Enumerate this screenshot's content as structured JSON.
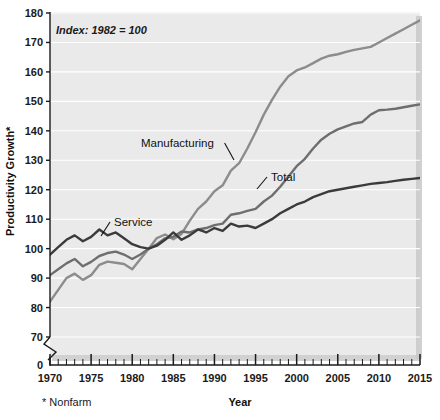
{
  "chart_data": {
    "type": "line",
    "title": "",
    "subtitle": "",
    "note": "Index: 1982 = 100",
    "footnote": "* Nonfarm",
    "xlabel": "Year",
    "ylabel": "Productivity Growth*",
    "xlim": [
      1970,
      2015
    ],
    "ylim": [
      70,
      180
    ],
    "y_axis_break": true,
    "y_break_value": 0,
    "grid": true,
    "grid_orientation": "horizontal",
    "legend_position": "inline-annotations",
    "xticks": [
      1970,
      1975,
      1980,
      1985,
      1990,
      1995,
      2000,
      2005,
      2010,
      2015
    ],
    "xtick_labels": [
      "1970",
      "1975",
      "1980",
      "1985",
      "1990",
      "1995",
      "2000",
      "2005",
      "2010",
      "2015"
    ],
    "xminor_step": 1,
    "yticks": [
      0,
      70,
      80,
      90,
      100,
      110,
      120,
      130,
      140,
      150,
      160,
      170,
      180
    ],
    "ytick_labels": [
      "0",
      "70",
      "80",
      "90",
      "100",
      "110",
      "120",
      "130",
      "140",
      "150",
      "160",
      "170",
      "180"
    ],
    "x": [
      1970,
      1971,
      1972,
      1973,
      1974,
      1975,
      1976,
      1977,
      1978,
      1979,
      1980,
      1981,
      1982,
      1983,
      1984,
      1985,
      1986,
      1987,
      1988,
      1989,
      1990,
      1991,
      1992,
      1993,
      1994,
      1995,
      1996,
      1997,
      1998,
      1999,
      2000,
      2001,
      2002,
      2003,
      2004,
      2005,
      2006,
      2007,
      2008,
      2009,
      2010,
      2011,
      2012,
      2013,
      2014,
      2015
    ],
    "series": [
      {
        "name": "Manufacturing",
        "color": "#8c8c8c",
        "label": "Manufacturing",
        "values": [
          82.0,
          86.0,
          90.0,
          91.5,
          89.4,
          91.0,
          94.5,
          95.6,
          95.2,
          94.8,
          93.0,
          96.5,
          100.0,
          103.6,
          104.8,
          103.2,
          105.0,
          109.5,
          113.5,
          116.0,
          119.5,
          121.5,
          126.5,
          129.0,
          134.0,
          139.5,
          145.5,
          150.5,
          155.0,
          158.5,
          160.5,
          161.5,
          163.0,
          164.5,
          165.5,
          166.0,
          166.8,
          167.5,
          168.0,
          168.5,
          170.0,
          171.5,
          173.0,
          174.5,
          176.0,
          177.5
        ]
      },
      {
        "name": "Total",
        "color": "#6e6e6e",
        "label": "Total",
        "values": [
          91.0,
          93.0,
          95.0,
          96.5,
          94.0,
          95.5,
          97.5,
          98.5,
          99.0,
          98.0,
          96.5,
          98.0,
          100.0,
          101.5,
          103.5,
          104.0,
          105.8,
          105.5,
          106.5,
          107.0,
          108.0,
          108.5,
          111.5,
          112.0,
          112.8,
          113.5,
          116.0,
          118.0,
          121.0,
          124.5,
          128.0,
          130.5,
          134.0,
          137.0,
          139.0,
          140.5,
          141.5,
          142.5,
          143.0,
          145.5,
          147.0,
          147.2,
          147.5,
          148.0,
          148.5,
          149.0
        ]
      },
      {
        "name": "Service",
        "color": "#3b3b3b",
        "label": "Service",
        "values": [
          98.0,
          100.5,
          103.0,
          104.5,
          102.5,
          104.0,
          106.5,
          104.5,
          105.5,
          103.5,
          101.5,
          100.5,
          100.0,
          101.0,
          103.0,
          105.5,
          103.0,
          104.5,
          106.5,
          105.5,
          107.0,
          106.0,
          108.5,
          107.5,
          107.8,
          107.0,
          108.5,
          110.0,
          112.0,
          113.5,
          115.0,
          116.0,
          117.5,
          118.5,
          119.5,
          120.0,
          120.5,
          121.0,
          121.5,
          122.0,
          122.3,
          122.6,
          123.0,
          123.4,
          123.7,
          124.0
        ]
      }
    ],
    "annotations": [
      {
        "text": "Manufacturing",
        "x_px": 141,
        "y_px": 147,
        "leader_to_x_px": 234,
        "leader_to_y_px": 160
      },
      {
        "text": "Total",
        "x_px": 271,
        "y_px": 181,
        "leader_to_x_px": 257,
        "leader_to_y_px": 189
      },
      {
        "text": "Service",
        "x_px": 114,
        "y_px": 226,
        "leader_to_x_px": 101,
        "leader_to_y_px": 236
      }
    ]
  },
  "style": {
    "plot_background": "#eaeaea",
    "grid_color": "#ffffff",
    "axis_color": "#1a1a1a",
    "page_background": "#ffffff"
  }
}
